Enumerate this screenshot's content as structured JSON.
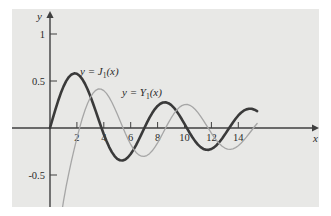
{
  "chart_data": {
    "type": "line",
    "title": "",
    "xlabel": "x",
    "ylabel": "y",
    "xlim": [
      -0.6,
      15.6
    ],
    "ylim": [
      -0.78,
      1.22
    ],
    "grid": false,
    "legend_position": "inline-annotations",
    "x_ticks": [
      2,
      4,
      6,
      8,
      10,
      12,
      14
    ],
    "x_tick_labels": [
      "2",
      "4",
      "6",
      "8",
      "10",
      "12",
      "14"
    ],
    "y_ticks": [
      1,
      0.5,
      -0.5
    ],
    "y_tick_labels": [
      "1",
      "0.5",
      "-0.5"
    ],
    "series": [
      {
        "name": "y = J_1(x)",
        "label_text": "y = J",
        "label_sub": "1",
        "label_tail": "(x)",
        "color": "#3a3a3a",
        "width": 2.6,
        "x": [
          0.0,
          0.2,
          0.4,
          0.6,
          0.8,
          1.0,
          1.2,
          1.4,
          1.6,
          1.8,
          2.0,
          2.2,
          2.4,
          2.6,
          2.8,
          3.0,
          3.2,
          3.4,
          3.6,
          3.8,
          4.0,
          4.2,
          4.4,
          4.6,
          4.8,
          5.0,
          5.2,
          5.4,
          5.6,
          5.8,
          6.0,
          6.2,
          6.4,
          6.6,
          6.8,
          7.0,
          7.2,
          7.4,
          7.6,
          7.8,
          8.0,
          8.2,
          8.4,
          8.6,
          8.8,
          9.0,
          9.2,
          9.4,
          9.6,
          9.8,
          10.0,
          10.2,
          10.4,
          10.6,
          10.8,
          11.0,
          11.2,
          11.4,
          11.6,
          11.8,
          12.0,
          12.2,
          12.4,
          12.6,
          12.8,
          13.0,
          13.2,
          13.4,
          13.6,
          13.8,
          14.0,
          14.2,
          14.4,
          14.6,
          14.8,
          15.0,
          15.2,
          15.4
        ],
        "y": [
          0.0,
          0.0995,
          0.196,
          0.2867,
          0.3688,
          0.4401,
          0.4983,
          0.5419,
          0.5699,
          0.5815,
          0.5767,
          0.556,
          0.5202,
          0.4708,
          0.4097,
          0.3391,
          0.2613,
          0.1792,
          0.0955,
          0.0128,
          -0.066,
          -0.1386,
          -0.2028,
          -0.2566,
          -0.2985,
          -0.3276,
          -0.3432,
          -0.3453,
          -0.3343,
          -0.311,
          -0.2767,
          -0.2329,
          -0.1816,
          -0.125,
          -0.0652,
          -0.0047,
          0.0543,
          0.1096,
          0.1592,
          0.2014,
          0.2346,
          0.258,
          0.2708,
          0.2728,
          0.2641,
          0.2453,
          0.2174,
          0.1816,
          0.1395,
          0.0928,
          0.0435,
          -0.0066,
          -0.0555,
          -0.1012,
          -0.1422,
          -0.1768,
          -0.2039,
          -0.2225,
          -0.232,
          -0.2323,
          -0.2234,
          -0.206,
          -0.1807,
          -0.1487,
          -0.1114,
          -0.0703,
          -0.0271,
          0.0166,
          0.059,
          0.0986,
          0.1334,
          0.1624,
          0.1843,
          0.1983,
          0.2041,
          0.2051,
          0.1947,
          0.1794
        ]
      },
      {
        "name": "y = Y_1(x)",
        "label_text": "y = Y",
        "label_sub": "1",
        "label_tail": "(x)",
        "color": "#a6a6a6",
        "width": 1.3,
        "x": [
          0.42,
          0.5,
          0.6,
          0.7,
          0.8,
          0.9,
          1.0,
          1.2,
          1.4,
          1.6,
          1.8,
          2.0,
          2.2,
          2.4,
          2.6,
          2.8,
          3.0,
          3.2,
          3.4,
          3.6,
          3.8,
          4.0,
          4.2,
          4.4,
          4.6,
          4.8,
          5.0,
          5.2,
          5.4,
          5.6,
          5.8,
          6.0,
          6.2,
          6.4,
          6.6,
          6.8,
          7.0,
          7.2,
          7.4,
          7.6,
          7.8,
          8.0,
          8.2,
          8.4,
          8.6,
          8.8,
          9.0,
          9.2,
          9.4,
          9.6,
          9.8,
          10.0,
          10.2,
          10.4,
          10.6,
          10.8,
          11.0,
          11.2,
          11.4,
          11.6,
          11.8,
          12.0,
          12.2,
          12.4,
          12.6,
          12.8,
          13.0,
          13.2,
          13.4,
          13.6,
          13.8,
          14.0,
          14.2,
          14.4,
          14.6,
          14.8,
          15.0,
          15.2,
          15.4
        ],
        "y": [
          -1.62,
          -1.471,
          -1.26,
          -1.103,
          -0.978,
          -0.873,
          -0.781,
          -0.621,
          -0.479,
          -0.347,
          -0.224,
          -0.107,
          0.0015,
          0.1005,
          0.1884,
          0.2635,
          0.3247,
          0.3707,
          0.401,
          0.4154,
          0.4141,
          0.3979,
          0.368,
          0.326,
          0.2737,
          0.2136,
          0.1479,
          0.0792,
          0.0101,
          -0.0568,
          -0.1192,
          -0.175,
          -0.2223,
          -0.2596,
          -0.2858,
          -0.3002,
          -0.3027,
          -0.2934,
          -0.2731,
          -0.2428,
          -0.2039,
          -0.1581,
          -0.1072,
          -0.0535,
          0.0011,
          0.0544,
          0.1043,
          0.1491,
          0.1871,
          0.2171,
          0.2379,
          0.249,
          0.2501,
          0.2414,
          0.2234,
          0.197,
          0.1637,
          0.1246,
          0.0815,
          0.0362,
          -0.0097,
          -0.0547,
          -0.097,
          -0.1352,
          -0.168,
          -0.1944,
          -0.2133,
          -0.2243,
          -0.2271,
          -0.2218,
          -0.2088,
          -0.1888,
          -0.1629,
          -0.1321,
          -0.0977,
          -0.0611,
          -0.0237,
          0.0132,
          0.0481
        ]
      }
    ]
  },
  "axes": {
    "x_axis_name": "x",
    "y_axis_name": "y"
  },
  "annotations": [
    {
      "id": "j1-label",
      "text": "y = J",
      "sub": "1",
      "tail": "(x)"
    },
    {
      "id": "y1-label",
      "text": "y = Y",
      "sub": "1",
      "tail": "(x)"
    }
  ],
  "colors": {
    "background": "#ffffff",
    "plot_background": "#e8e8e6",
    "axis": "#3f3f3f",
    "j1_curve": "#3a3a3a",
    "y1_curve": "#a6a6a6",
    "text": "#2a2a2a"
  }
}
